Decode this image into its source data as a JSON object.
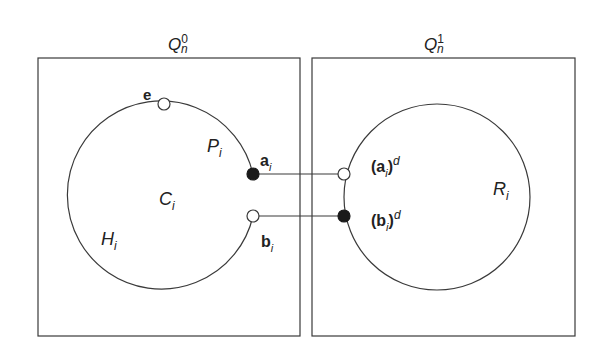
{
  "figure": {
    "boxes": [
      {
        "id": "Q0",
        "label_main": "Q",
        "label_sub": "n",
        "label_sup": "0"
      },
      {
        "id": "Q1",
        "label_main": "Q",
        "label_sub": "n",
        "label_sup": "1"
      }
    ],
    "left_cycle": {
      "center_label_main": "C",
      "center_label_sub": "i",
      "path_p_main": "P",
      "path_p_sub": "i",
      "path_h_main": "H",
      "path_h_sub": "i"
    },
    "right_cycle": {
      "label_main": "R",
      "label_sub": "i"
    },
    "vertices": {
      "e": {
        "label": "e",
        "style": "open"
      },
      "a": {
        "label_main": "a",
        "label_sub": "i",
        "style": "filled"
      },
      "b": {
        "label_main": "b",
        "label_sub": "i",
        "style": "open"
      },
      "a_d": {
        "open_paren": "(",
        "label_main": "a",
        "label_sub": "i",
        "close_paren": ")",
        "label_sup": "d",
        "style": "open"
      },
      "b_d": {
        "open_paren": "(",
        "label_main": "b",
        "label_sub": "i",
        "close_paren": ")",
        "label_sup": "d",
        "style": "filled"
      }
    },
    "edges": [
      {
        "from": "a",
        "to": "a_d"
      },
      {
        "from": "b",
        "to": "b_d"
      }
    ],
    "colors": {
      "stroke": "#3a3a3a",
      "fill_filled": "#1a1a1a",
      "fill_open": "#ffffff"
    }
  }
}
